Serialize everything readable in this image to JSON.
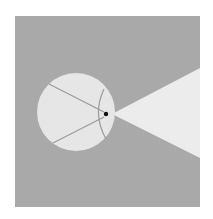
{
  "diagram": {
    "colors": {
      "page_background": "#ffffff",
      "panel": "#a9a9a9",
      "circle_fill": "#e6e6e6",
      "cone_fill": "#ececec",
      "inner_lines": "#9a9a9a",
      "focal_point": "#111111"
    },
    "panel": {
      "x": 15,
      "y": 16,
      "width": 185,
      "height": 191
    },
    "circle": {
      "cx": 76,
      "cy": 112,
      "r": 39
    },
    "focal_point": {
      "x": 106,
      "y": 114,
      "r": 2.2
    },
    "cone": {
      "apex_x": 112,
      "apex_y": 114,
      "end_x": 200,
      "end_top_y": 68,
      "end_bottom_y": 158
    },
    "lines": [
      {
        "x1": 49,
        "y1": 84,
        "x2": 104,
        "y2": 112
      },
      {
        "x1": 53,
        "y1": 143,
        "x2": 104,
        "y2": 117
      }
    ],
    "arc": {
      "x1": 104,
      "y1": 89,
      "cx": 92,
      "cy": 114,
      "x2": 106,
      "y2": 139
    }
  }
}
